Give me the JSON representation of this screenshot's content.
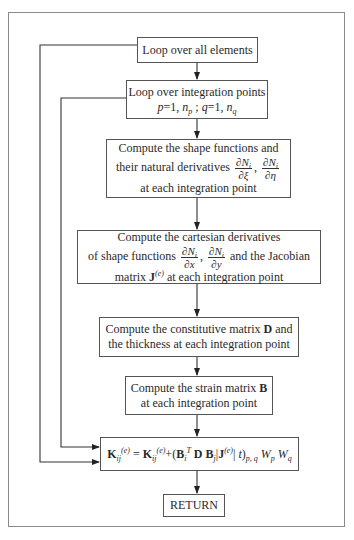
{
  "diagram": {
    "type": "flowchart",
    "nodes": [
      {
        "id": "loop_elements",
        "label": "Loop over all elements"
      },
      {
        "id": "loop_points",
        "line1": "Loop over integration points",
        "p_var": "p",
        "p_eq": "=1,",
        "np": "n",
        "np_sub": "p",
        "sep": ";",
        "q_var": "q",
        "q_eq": "=1,",
        "nq": "n",
        "nq_sub": "q"
      },
      {
        "id": "shape_functions",
        "line1": "Compute the shape functions and",
        "line2_prefix": "their natural derivatives",
        "frac1_num": "∂N",
        "frac1_num_sub": "i",
        "frac1_den": "∂ξ",
        "comma": ",",
        "frac2_num": "∂N",
        "frac2_num_sub": "i",
        "frac2_den": "∂η",
        "line3": "at each integration point"
      },
      {
        "id": "cartesian",
        "line1": "Compute the cartesian derivatives",
        "line2_prefix": "of shape functions",
        "frac1_num": "∂N",
        "frac1_num_sub": "i",
        "frac1_den": "∂x",
        "comma": ",",
        "frac2_num": "∂N",
        "frac2_num_sub": "i",
        "frac2_den": "∂y",
        "line2_suffix": "and the Jacobian",
        "line3_prefix": "matrix",
        "J": "J",
        "J_sup": "(e)",
        "line3_suffix": "at each integration point"
      },
      {
        "id": "constitutive",
        "line1_prefix": "Compute the constitutive matrix",
        "D": "D",
        "line1_suffix": "and",
        "line2": "the thickness at each integration point"
      },
      {
        "id": "strain",
        "line1_prefix": "Compute the strain matrix",
        "B": "B",
        "line2": "at each integration point"
      },
      {
        "id": "stiffness_update",
        "K": "K",
        "K_sub": "ij",
        "K_sup": "(e)",
        "eq": "=",
        "plus": "+(",
        "Bi": "B",
        "Bi_sub": "i",
        "Bi_sup": "T",
        "D": "D",
        "Bj": "B",
        "Bj_sub": "j",
        "bar": "|",
        "J": "J",
        "J_sup": "(e)",
        "bar2": "|",
        "t": "t",
        "close": ")",
        "pq_sub": "p, q",
        "Wp": "W",
        "Wp_sub": "p",
        "Wq": "W",
        "Wq_sub": "q"
      },
      {
        "id": "return",
        "label": "RETURN"
      }
    ],
    "edges": [
      {
        "from": "loop_elements",
        "to": "loop_points"
      },
      {
        "from": "loop_points",
        "to": "shape_functions"
      },
      {
        "from": "shape_functions",
        "to": "cartesian"
      },
      {
        "from": "cartesian",
        "to": "constitutive"
      },
      {
        "from": "constitutive",
        "to": "strain"
      },
      {
        "from": "strain",
        "to": "stiffness_update"
      },
      {
        "from": "stiffness_update",
        "to": "return"
      },
      {
        "from": "loop_points",
        "to": "stiffness_update",
        "type": "loop-back (inner)"
      },
      {
        "from": "loop_elements",
        "to": "stiffness_update",
        "type": "loop-back (outer)"
      }
    ],
    "colors": {
      "line": "#333333",
      "frame": "#8a8a8a",
      "background": "#ffffff"
    }
  }
}
